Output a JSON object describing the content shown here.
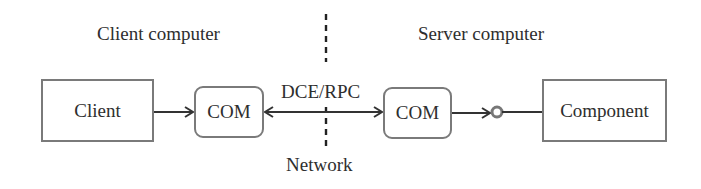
{
  "diagram": {
    "title": "",
    "regions": {
      "client_label": "Client computer",
      "server_label": "Server computer"
    },
    "nodes": {
      "client": "Client",
      "client_com": "COM",
      "server_com": "COM",
      "component": "Component"
    },
    "edges": {
      "dce_rpc_label": "DCE/RPC",
      "network_label": "Network"
    },
    "connections": [
      {
        "from": "Client",
        "to": "COM (client)",
        "type": "arrow"
      },
      {
        "from": "COM (client)",
        "to": "COM (server)",
        "type": "bidirectional-arrow",
        "label": "DCE/RPC"
      },
      {
        "from": "COM (server)",
        "to": "Component interface",
        "type": "arrow"
      },
      {
        "from": "Component interface",
        "to": "Component",
        "type": "lollipop-interface"
      }
    ],
    "colors": {
      "stroke": "#333333",
      "box_border": "#7a7a7a",
      "text": "#2e2e2e",
      "background": "#ffffff"
    }
  }
}
